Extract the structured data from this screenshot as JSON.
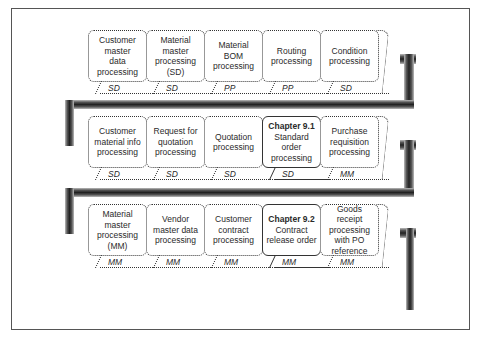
{
  "rows": [
    {
      "boxes": [
        {
          "lines": [
            "Customer",
            "master",
            "data",
            "processing"
          ],
          "module": "SD",
          "highlight": false
        },
        {
          "lines": [
            "Material",
            "master",
            "processing",
            "(SD)"
          ],
          "module": "SD",
          "highlight": false
        },
        {
          "lines": [
            "Material",
            "BOM",
            "processing"
          ],
          "module": "PP",
          "highlight": false
        },
        {
          "lines": [
            "Routing",
            "processing"
          ],
          "module": "PP",
          "highlight": false
        },
        {
          "lines": [
            "Condition",
            "processing"
          ],
          "module": "SD",
          "highlight": false
        }
      ]
    },
    {
      "boxes": [
        {
          "lines": [
            "Customer",
            "material info",
            "processing"
          ],
          "module": "SD",
          "highlight": false
        },
        {
          "lines": [
            "Request for",
            "quotation",
            "processing"
          ],
          "module": "SD",
          "highlight": false
        },
        {
          "lines": [
            "Quotation",
            "processing"
          ],
          "module": "SD",
          "highlight": false
        },
        {
          "chapter": "Chapter 9.1",
          "lines": [
            "Standard",
            "order",
            "processing"
          ],
          "module": "SD",
          "highlight": true
        },
        {
          "lines": [
            "Purchase",
            "requisition",
            "processing"
          ],
          "module": "MM",
          "highlight": false
        }
      ]
    },
    {
      "boxes": [
        {
          "lines": [
            "Material",
            "master",
            "processing",
            "(MM)"
          ],
          "module": "MM",
          "highlight": false
        },
        {
          "lines": [
            "Vendor",
            "master data",
            "processing"
          ],
          "module": "MM",
          "highlight": false
        },
        {
          "lines": [
            "Customer",
            "contract",
            "processing"
          ],
          "module": "MM",
          "highlight": false
        },
        {
          "chapter": "Chapter 9.2",
          "lines": [
            "Contract",
            "release order"
          ],
          "module": "MM",
          "highlight": true
        },
        {
          "lines": [
            "Goods receipt",
            "processing",
            "with PO",
            "reference"
          ],
          "module": "MM",
          "highlight": false
        }
      ]
    }
  ]
}
